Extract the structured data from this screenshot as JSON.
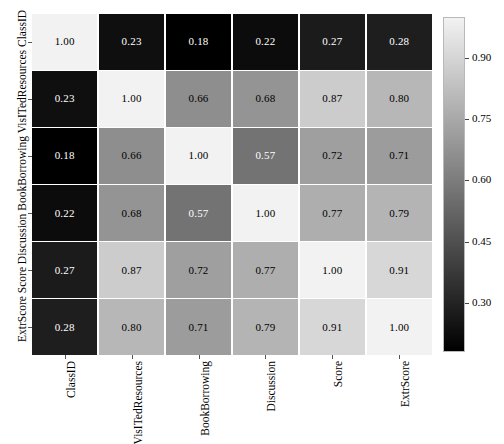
{
  "chart_data": {
    "type": "heatmap",
    "title": "",
    "xlabel": "",
    "ylabel": "ExtrScore Score Discussion BookBorrowing VisITedResources ClassID",
    "categories_x": [
      "ClassID",
      "VisITedResources",
      "BookBorrowing",
      "Discussion",
      "Score",
      "ExtrScore"
    ],
    "categories_y": [
      "ClassID",
      "VisITedResources",
      "BookBorrowing",
      "Discussion",
      "Score",
      "ExtrScore"
    ],
    "values": [
      [
        1.0,
        0.23,
        0.18,
        0.22,
        0.27,
        0.28
      ],
      [
        0.23,
        1.0,
        0.66,
        0.68,
        0.87,
        0.8
      ],
      [
        0.18,
        0.66,
        1.0,
        0.57,
        0.72,
        0.71
      ],
      [
        0.22,
        0.68,
        0.57,
        1.0,
        0.77,
        0.79
      ],
      [
        0.27,
        0.87,
        0.72,
        0.77,
        1.0,
        0.91
      ],
      [
        0.28,
        0.8,
        0.71,
        0.79,
        0.91,
        1.0
      ]
    ],
    "cell_labels": [
      [
        "1.00",
        "0.23",
        "0.18",
        "0.22",
        "0.27",
        "0.28"
      ],
      [
        "0.23",
        "1.00",
        "0.66",
        "0.68",
        "0.87",
        "0.80"
      ],
      [
        "0.18",
        "0.66",
        "1.00",
        "0.57",
        "0.72",
        "0.71"
      ],
      [
        "0.22",
        "0.68",
        "0.57",
        "1.00",
        "0.77",
        "0.79"
      ],
      [
        "0.27",
        "0.87",
        "0.72",
        "0.77",
        "1.00",
        "0.91"
      ],
      [
        "0.28",
        "0.80",
        "0.71",
        "0.79",
        "0.91",
        "1.00"
      ]
    ],
    "colormap": "gray",
    "vmin": 0.18,
    "vmax": 1.0,
    "grid": false,
    "legend": "colorbar",
    "legend_position": "right",
    "colorbar": {
      "ticks": [
        "0.90",
        "0.75",
        "0.60",
        "0.45",
        "0.30"
      ],
      "tick_values": [
        0.9,
        0.75,
        0.6,
        0.45,
        0.3
      ],
      "min_color": "#000000",
      "max_color": "#f2f2f2"
    }
  },
  "axes": {
    "y_title": "ExtrScore Score Discussion BookBorrowing VisITedResources ClassID",
    "y_ticks": [
      "ClassID",
      "VisITedResources",
      "BookBorrowing",
      "Discussion",
      "Score",
      "ExtrScore"
    ],
    "x_ticks": [
      "ClassID",
      "VisITedResources",
      "BookBorrowing",
      "Discussion",
      "Score",
      "ExtrScore"
    ]
  },
  "colors": {
    "background": "#ffffff",
    "tick_color": "#555555",
    "text_dark": "#000000",
    "text_light": "#ffffff"
  }
}
